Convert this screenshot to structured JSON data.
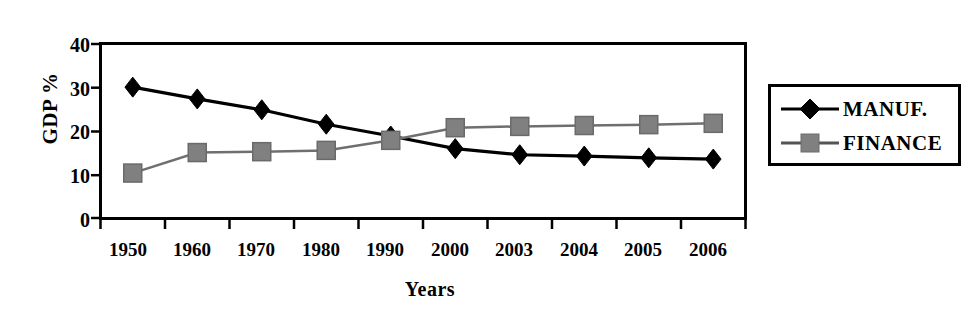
{
  "chart_data": {
    "type": "line",
    "title": "",
    "subtitle": "",
    "xlabel": "Years",
    "ylabel": "GDP %",
    "categories": [
      "1950",
      "1960",
      "1970",
      "1980",
      "1990",
      "2000",
      "2003",
      "2004",
      "2005",
      "2006"
    ],
    "series": [
      {
        "name": "MANUF.",
        "marker": "diamond",
        "color": "#000000",
        "values": [
          30.0,
          27.3,
          24.8,
          21.5,
          18.8,
          15.9,
          14.5,
          14.2,
          13.8,
          13.5
        ]
      },
      {
        "name": "FINANCE",
        "marker": "square",
        "color": "#808080",
        "values": [
          10.3,
          15.0,
          15.2,
          15.5,
          17.8,
          20.7,
          21.0,
          21.2,
          21.4,
          21.7
        ]
      }
    ],
    "ylim": [
      0,
      40
    ],
    "yticks": [
      0,
      10,
      20,
      30,
      40
    ],
    "ytick_labels": [
      "0",
      "10",
      "20",
      "30",
      "40"
    ],
    "grid": false,
    "legend_position": "right-outside",
    "legend_entries": [
      "MANUF.",
      "FINANCE"
    ],
    "axis_color": "#000000",
    "frame": true,
    "background": "#ffffff"
  },
  "legend": {
    "manuf_label": "MANUF.",
    "finance_label": "FINANCE"
  },
  "axes": {
    "y_title": "GDP %",
    "x_title": "Years",
    "ytick_0": "0",
    "ytick_10": "10",
    "ytick_20": "20",
    "ytick_30": "30",
    "ytick_40": "40",
    "xtick_0": "1950",
    "xtick_1": "1960",
    "xtick_2": "1970",
    "xtick_3": "1980",
    "xtick_4": "1990",
    "xtick_5": "2000",
    "xtick_6": "2003",
    "xtick_7": "2004",
    "xtick_8": "2005",
    "xtick_9": "2006"
  }
}
